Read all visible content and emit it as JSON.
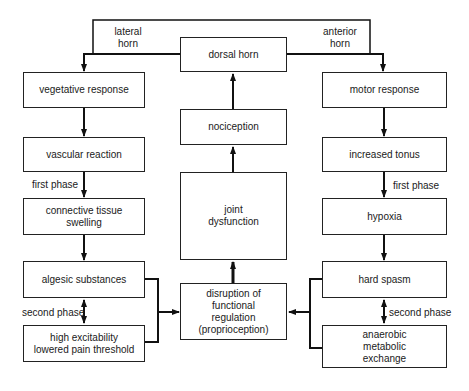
{
  "center": {
    "dorsal_horn": "dorsal horn",
    "nociception": "nociception",
    "joint_dysfunction": "joint\ndysfunction",
    "disruption": "disruption of\nfunctional\nregulation\n(proprioception)"
  },
  "left": {
    "vegetative": "vegetative response",
    "vascular": "vascular reaction",
    "connective": "connective tissue\nswelling",
    "algesic": "algesic substances",
    "excitability": "high excitability\nlowered pain threshold"
  },
  "right": {
    "motor": "motor response",
    "tonus": "increased tonus",
    "hypoxia": "hypoxia",
    "spasm": "hard spasm",
    "anaerobic": "anaerobic\nmetabolic\nexchange"
  },
  "labels": {
    "lateral_horn": "lateral\nhorn",
    "anterior_horn": "anterior\nhorn",
    "left_first_phase": "first phase",
    "right_first_phase": "first phase",
    "left_second_phase": "second phase",
    "right_second_phase": "second phase"
  }
}
